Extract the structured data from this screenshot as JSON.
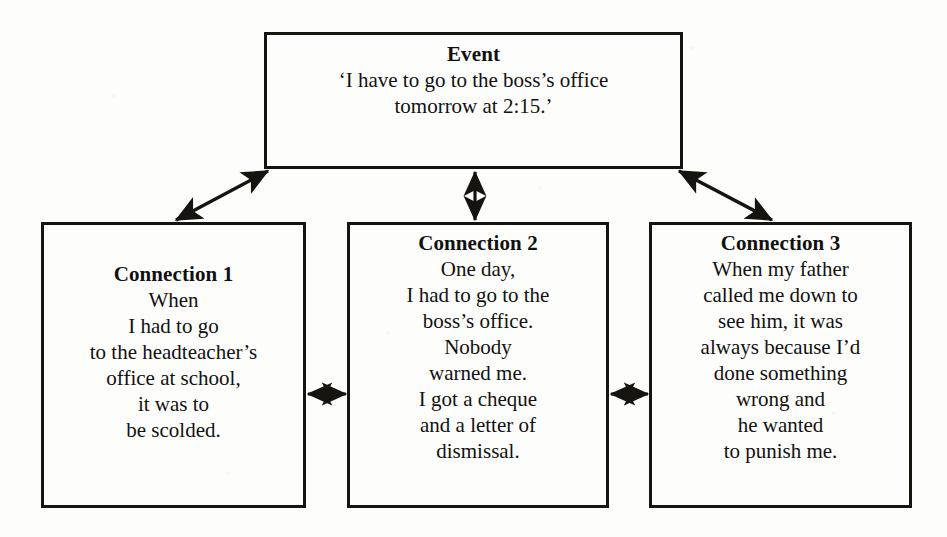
{
  "diagram": {
    "type": "connection-web-diagram",
    "ink_color": "#15140f",
    "background_color": "#fdfdfc",
    "event": {
      "title": "Event",
      "lines": [
        "‘I have to go to the boss’s office",
        "tomorrow at 2:15.’"
      ]
    },
    "connections": [
      {
        "title": "Connection 1",
        "lines": [
          "When",
          "I had to go",
          "to the headteacher’s",
          "office at school,",
          "it was to",
          "be scolded."
        ]
      },
      {
        "title": "Connection 2",
        "lines": [
          "One day,",
          "I had to go to the",
          "boss’s office.",
          "Nobody",
          "warned me.",
          "I got a cheque",
          "and a letter of",
          "dismissal."
        ]
      },
      {
        "title": "Connection 3",
        "lines": [
          "When my father",
          "called me down to",
          "see him, it was",
          "always because I’d",
          "done something",
          "wrong and",
          "he wanted",
          "to punish me."
        ]
      }
    ],
    "arrows": [
      {
        "name": "event-to-connection-1",
        "style": "double-headed",
        "orientation": "diagonal-left"
      },
      {
        "name": "event-to-connection-2",
        "style": "double-headed",
        "orientation": "vertical"
      },
      {
        "name": "event-to-connection-3",
        "style": "double-headed",
        "orientation": "diagonal-right"
      },
      {
        "name": "connection-1-to-connection-2",
        "style": "double-headed",
        "orientation": "horizontal"
      },
      {
        "name": "connection-2-to-connection-3",
        "style": "double-headed",
        "orientation": "horizontal"
      }
    ]
  }
}
